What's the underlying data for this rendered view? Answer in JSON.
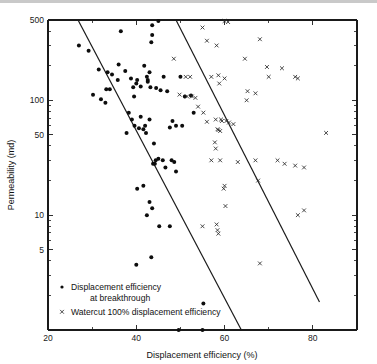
{
  "chart_data": {
    "type": "scatter",
    "title": "",
    "xlabel": "Displacement efficiency (%)",
    "ylabel": "Permeability (md)",
    "xlim": [
      20,
      90
    ],
    "ylim": [
      1,
      500
    ],
    "yscale": "log",
    "xscale": "linear",
    "grid": false,
    "legend_position": "lower-left",
    "x_ticks": [
      {
        "value": 20,
        "label": "20"
      },
      {
        "value": 30,
        "label": ""
      },
      {
        "value": 40,
        "label": "40"
      },
      {
        "value": 50,
        "label": ""
      },
      {
        "value": 60,
        "label": "60"
      },
      {
        "value": 70,
        "label": ""
      },
      {
        "value": 80,
        "label": "80"
      },
      {
        "value": 90,
        "label": ""
      }
    ],
    "y_ticks": [
      {
        "value": 500,
        "label": "500"
      },
      {
        "value": 400,
        "label": ""
      },
      {
        "value": 300,
        "label": ""
      },
      {
        "value": 200,
        "label": ""
      },
      {
        "value": 100,
        "label": "100"
      },
      {
        "value": 90,
        "label": ""
      },
      {
        "value": 80,
        "label": ""
      },
      {
        "value": 70,
        "label": ""
      },
      {
        "value": 60,
        "label": ""
      },
      {
        "value": 50,
        "label": "50"
      },
      {
        "value": 40,
        "label": ""
      },
      {
        "value": 30,
        "label": ""
      },
      {
        "value": 20,
        "label": ""
      },
      {
        "value": 10,
        "label": "10"
      },
      {
        "value": 9,
        "label": ""
      },
      {
        "value": 8,
        "label": ""
      },
      {
        "value": 7,
        "label": ""
      },
      {
        "value": 6,
        "label": ""
      },
      {
        "value": 5,
        "label": "5"
      },
      {
        "value": 4,
        "label": ""
      },
      {
        "value": 3,
        "label": ""
      },
      {
        "value": 2,
        "label": ""
      },
      {
        "value": 1,
        "label": ""
      }
    ],
    "series": [
      {
        "name": "Displacement efficiency at breakthrough",
        "marker": "dot",
        "color": "#0d0d0d",
        "points": [
          [
            27.0,
            300
          ],
          [
            29.2,
            270
          ],
          [
            31.5,
            185
          ],
          [
            33.5,
            175
          ],
          [
            36.5,
            400
          ],
          [
            30.2,
            112
          ],
          [
            32.0,
            102
          ],
          [
            33.2,
            125
          ],
          [
            34.0,
            125
          ],
          [
            33.0,
            95
          ],
          [
            35.8,
            150
          ],
          [
            37.5,
            180
          ],
          [
            38.8,
            155
          ],
          [
            39.3,
            130
          ],
          [
            40.0,
            140
          ],
          [
            40.2,
            150
          ],
          [
            41.0,
            132
          ],
          [
            42.4,
            160
          ],
          [
            42.6,
            150
          ],
          [
            42.6,
            145
          ],
          [
            43.0,
            175
          ],
          [
            43.2,
            130
          ],
          [
            43.6,
            450
          ],
          [
            43.6,
            370
          ],
          [
            43.4,
            320
          ],
          [
            44.5,
            128
          ],
          [
            45.0,
            490
          ],
          [
            46.2,
            160
          ],
          [
            37.8,
            52
          ],
          [
            38.3,
            78
          ],
          [
            39.0,
            68
          ],
          [
            39.6,
            60
          ],
          [
            40.6,
            57
          ],
          [
            41.0,
            72
          ],
          [
            41.6,
            56
          ],
          [
            42.0,
            60
          ],
          [
            42.2,
            52
          ],
          [
            43.0,
            68
          ],
          [
            44.0,
            42
          ],
          [
            44.4,
            30
          ],
          [
            45.0,
            31
          ],
          [
            43.8,
            28
          ],
          [
            44.2,
            28
          ],
          [
            46.0,
            30
          ],
          [
            46.6,
            26
          ],
          [
            47.6,
            58
          ],
          [
            48.2,
            66
          ],
          [
            49.0,
            60
          ],
          [
            48.6,
            29
          ],
          [
            49.0,
            24
          ],
          [
            50.0,
            160
          ],
          [
            51.0,
            108
          ],
          [
            52.4,
            110
          ],
          [
            50.4,
            60
          ],
          [
            53.0,
            78
          ],
          [
            48.0,
            30
          ],
          [
            40.2,
            17
          ],
          [
            41.6,
            18
          ],
          [
            43.0,
            13
          ],
          [
            43.6,
            11.5
          ],
          [
            42.4,
            10
          ],
          [
            45.2,
            8
          ],
          [
            47.6,
            8
          ],
          [
            40.0,
            3.7
          ],
          [
            43.4,
            4.3
          ],
          [
            49.6,
            1.0
          ],
          [
            55.0,
            1.0
          ],
          [
            55.2,
            1.7
          ],
          [
            36.0,
            205
          ],
          [
            41.8,
            200
          ],
          [
            39.5,
            108
          ],
          [
            34.5,
            168
          ],
          [
            45.5,
            122
          ],
          [
            47.0,
            120
          ]
        ]
      },
      {
        "name": "Watercut 100% displacement efficiency",
        "marker": "x",
        "color": "#2a2a2a",
        "points": [
          [
            48.5,
            230
          ],
          [
            55.0,
            430
          ],
          [
            56.0,
            330
          ],
          [
            58.2,
            300
          ],
          [
            60.0,
            490
          ],
          [
            60.8,
            480
          ],
          [
            57.0,
            160
          ],
          [
            58.6,
            165
          ],
          [
            58.8,
            140
          ],
          [
            60.0,
            155
          ],
          [
            51.2,
            160
          ],
          [
            52.2,
            160
          ],
          [
            49.8,
            112
          ],
          [
            51.5,
            108
          ],
          [
            52.6,
            108
          ],
          [
            53.4,
            105
          ],
          [
            54.0,
            88
          ],
          [
            55.2,
            78
          ],
          [
            56.0,
            65
          ],
          [
            58.0,
            68
          ],
          [
            59.2,
            68
          ],
          [
            59.4,
            66
          ],
          [
            60.4,
            66
          ],
          [
            58.4,
            56
          ],
          [
            58.6,
            55
          ],
          [
            59.0,
            54
          ],
          [
            61.0,
            64
          ],
          [
            62.0,
            62
          ],
          [
            57.8,
            43
          ],
          [
            58.0,
            38
          ],
          [
            59.0,
            30
          ],
          [
            57.0,
            30
          ],
          [
            60.0,
            18
          ],
          [
            59.8,
            17
          ],
          [
            60.2,
            12
          ],
          [
            55.0,
            8
          ],
          [
            58.2,
            8.3
          ],
          [
            58.4,
            7.4
          ],
          [
            58.6,
            6.9
          ],
          [
            65.0,
            100
          ],
          [
            65.2,
            120
          ],
          [
            64.6,
            230
          ],
          [
            67.0,
            115
          ],
          [
            68.0,
            340
          ],
          [
            70.0,
            160
          ],
          [
            69.6,
            195
          ],
          [
            73.0,
            190
          ],
          [
            76.0,
            160
          ],
          [
            76.6,
            155
          ],
          [
            67.0,
            30
          ],
          [
            72.0,
            30
          ],
          [
            73.6,
            28
          ],
          [
            76.0,
            27
          ],
          [
            78.0,
            26
          ],
          [
            76.6,
            10
          ],
          [
            78.0,
            11
          ],
          [
            83.0,
            52
          ],
          [
            68.0,
            3.8
          ],
          [
            67.6,
            20
          ],
          [
            63.0,
            29
          ]
        ]
      }
    ],
    "trend_lines": [
      {
        "name": "breakthrough-trend",
        "x_start": 26.8,
        "y_start": 500,
        "x_end": 63.8,
        "y_end": 1.0
      },
      {
        "name": "watercut-trend",
        "x_start": 49.0,
        "y_start": 500,
        "x_end": 81.5,
        "y_end": 1.75
      }
    ],
    "legend": [
      {
        "marker": "dot",
        "line1": "Displacement efficiency",
        "line2": "at breakthrough"
      },
      {
        "marker": "x",
        "line1": "Watercut 100% displacement efficiency",
        "line2": ""
      }
    ]
  }
}
